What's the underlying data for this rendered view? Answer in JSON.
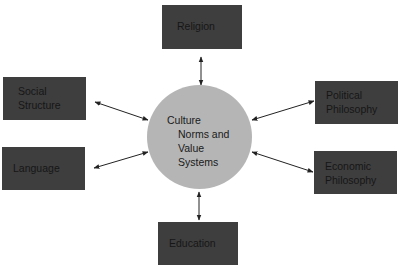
{
  "diagram": {
    "center": {
      "line1": "Culture",
      "line2": "Norms and",
      "line3": "Value",
      "line4": "Systems"
    },
    "nodes": {
      "religion": {
        "label": "Religion"
      },
      "social_structure": {
        "line1": "Social",
        "line2": "Structure"
      },
      "language": {
        "label": "Language"
      },
      "political_philosophy": {
        "line1": "Political",
        "line2": "Philosophy"
      },
      "economic_philosophy": {
        "line1": "Economic",
        "line2": "Philosophy"
      },
      "education": {
        "label": "Education"
      }
    },
    "edges": [
      {
        "from": "center",
        "to": "religion",
        "type": "bidirectional"
      },
      {
        "from": "center",
        "to": "social_structure",
        "type": "bidirectional"
      },
      {
        "from": "center",
        "to": "language",
        "type": "bidirectional"
      },
      {
        "from": "center",
        "to": "political_philosophy",
        "type": "bidirectional"
      },
      {
        "from": "center",
        "to": "economic_philosophy",
        "type": "bidirectional"
      },
      {
        "from": "center",
        "to": "education",
        "type": "bidirectional"
      }
    ],
    "colors": {
      "box_fill": "#3e3e3e",
      "circle_fill": "#b5b5b5",
      "text": "#161616",
      "arrow": "#222222"
    }
  }
}
